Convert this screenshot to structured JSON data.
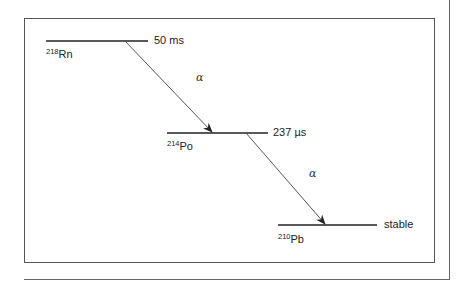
{
  "diagram": {
    "title": "",
    "levels": [
      {
        "mass": "218",
        "element": "Rn",
        "halflife": "50 ms"
      },
      {
        "mass": "214",
        "element": "Po",
        "halflife": "237 µs"
      },
      {
        "mass": "210",
        "element": "Pb",
        "halflife": "stable"
      }
    ],
    "transitions": [
      {
        "from": "218Rn",
        "to": "214Po",
        "label": "α"
      },
      {
        "from": "214Po",
        "to": "210Pb",
        "label": "α"
      }
    ],
    "colors": {
      "line": "#333333",
      "border": "#555555",
      "text": "#222222"
    }
  }
}
